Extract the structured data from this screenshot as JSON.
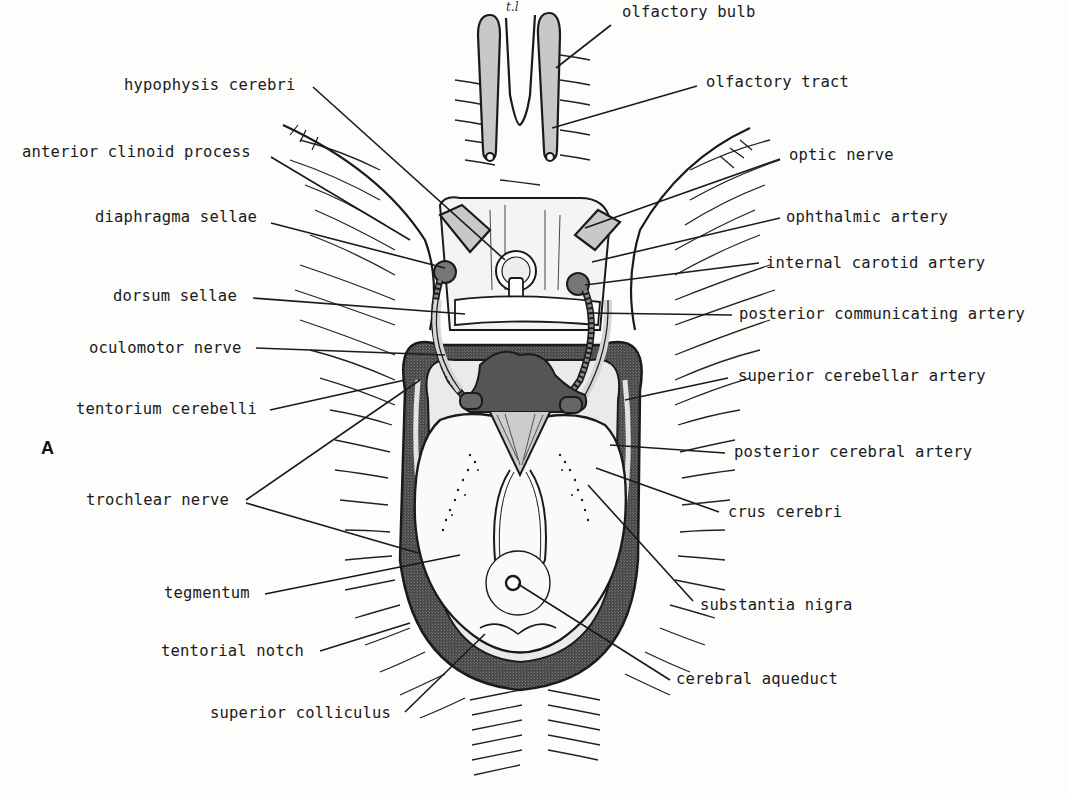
{
  "figure": {
    "panel_letter": "A",
    "hand_note": "t.l",
    "colors": {
      "background": "#fdfdfc",
      "ink": "#1a1a1a",
      "light_fill": "#cfcfcf",
      "mid_fill": "#9a9a9a",
      "dark_fill": "#555555"
    }
  },
  "labels": {
    "left": [
      {
        "id": "hypophysis-cerebri",
        "text": "hypophysis cerebri"
      },
      {
        "id": "anterior-clinoid-process",
        "text": "anterior clinoid process"
      },
      {
        "id": "diaphragma-sellae",
        "text": "diaphragma sellae"
      },
      {
        "id": "dorsum-sellae",
        "text": "dorsum sellae"
      },
      {
        "id": "oculomotor-nerve",
        "text": "oculomotor nerve"
      },
      {
        "id": "tentorium-cerebelli",
        "text": "tentorium cerebelli"
      },
      {
        "id": "trochlear-nerve",
        "text": "trochlear nerve"
      },
      {
        "id": "tegmentum",
        "text": "tegmentum"
      },
      {
        "id": "tentorial-notch",
        "text": "tentorial notch"
      },
      {
        "id": "superior-colliculus",
        "text": "superior colliculus"
      }
    ],
    "right": [
      {
        "id": "olfactory-bulb",
        "text": "olfactory bulb"
      },
      {
        "id": "olfactory-tract",
        "text": "olfactory tract"
      },
      {
        "id": "optic-nerve",
        "text": "optic nerve"
      },
      {
        "id": "ophthalmic-artery",
        "text": "ophthalmic artery"
      },
      {
        "id": "internal-carotid-artery",
        "text": "internal carotid artery"
      },
      {
        "id": "posterior-communicating-artery",
        "text": "posterior communicating artery"
      },
      {
        "id": "superior-cerebellar-artery",
        "text": "superior cerebellar artery"
      },
      {
        "id": "posterior-cerebral-artery",
        "text": "posterior cerebral artery"
      },
      {
        "id": "crus-cerebri",
        "text": "crus cerebri"
      },
      {
        "id": "substantia-nigra",
        "text": "substantia nigra"
      },
      {
        "id": "cerebral-aqueduct",
        "text": "cerebral aqueduct"
      }
    ]
  }
}
